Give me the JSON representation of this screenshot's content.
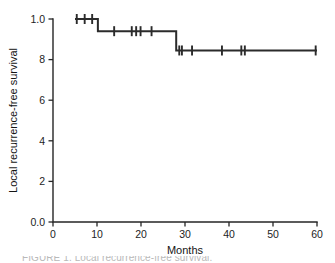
{
  "figure": {
    "caption": "FIGURE 1. Local recurrence-free survival."
  },
  "chart_data": {
    "type": "line",
    "plot_style": "kaplan-meier-step",
    "title": "",
    "xlabel": "Months",
    "ylabel": "Local recurrence-free survival",
    "xlim": [
      0,
      60
    ],
    "ylim": [
      0.0,
      1.0
    ],
    "grid": false,
    "legend": null,
    "x_ticks": [
      0,
      10,
      20,
      30,
      40,
      50,
      60
    ],
    "x_tick_labels": [
      "0",
      "10",
      "20",
      "30",
      "40",
      "50",
      "60"
    ],
    "y_ticks": [
      0.0,
      0.2,
      0.4,
      0.6,
      0.8,
      1.0
    ],
    "y_tick_labels": [
      "0.0",
      "2",
      "4",
      "6",
      "8",
      "1.0"
    ],
    "series": [
      {
        "name": "Local recurrence-free survival",
        "x": [
          5.0,
          10.2,
          10.2,
          28.0,
          28.0,
          60.0
        ],
        "y": [
          1.0,
          1.0,
          0.94,
          0.94,
          0.845,
          0.845
        ],
        "steps": [
          {
            "from_x": 5.0,
            "to_x": 10.2,
            "survival": 1.0
          },
          {
            "from_x": 10.2,
            "to_x": 28.0,
            "survival": 0.94
          },
          {
            "from_x": 28.0,
            "to_x": 60.0,
            "survival": 0.845
          }
        ],
        "events": [
          {
            "x": 10.2,
            "from_survival": 1.0,
            "to_survival": 0.94
          },
          {
            "x": 28.0,
            "from_survival": 0.94,
            "to_survival": 0.845
          }
        ],
        "censored": [
          {
            "x": 5.4,
            "y": 1.0
          },
          {
            "x": 7.2,
            "y": 1.0
          },
          {
            "x": 8.9,
            "y": 1.0
          },
          {
            "x": 13.9,
            "y": 0.94
          },
          {
            "x": 17.9,
            "y": 0.94
          },
          {
            "x": 18.9,
            "y": 0.94
          },
          {
            "x": 19.9,
            "y": 0.94
          },
          {
            "x": 22.4,
            "y": 0.94
          },
          {
            "x": 28.7,
            "y": 0.845
          },
          {
            "x": 29.3,
            "y": 0.845
          },
          {
            "x": 31.6,
            "y": 0.845
          },
          {
            "x": 38.4,
            "y": 0.845
          },
          {
            "x": 42.8,
            "y": 0.845
          },
          {
            "x": 43.6,
            "y": 0.845
          },
          {
            "x": 59.7,
            "y": 0.845
          }
        ]
      }
    ]
  },
  "colors": {
    "curve": "#2b2b2b",
    "axis": "#262626",
    "background": "#ffffff",
    "caption": "#b9b9b9"
  }
}
